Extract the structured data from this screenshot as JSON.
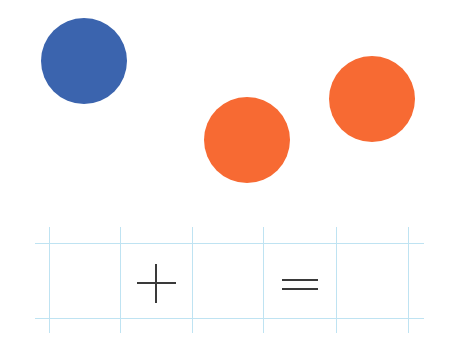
{
  "scene": {
    "description": "Counting dots addition worksheet",
    "dots": [
      {
        "color_name": "blue",
        "color": "#3b64ae",
        "cx": 84,
        "cy": 61,
        "r": 43
      },
      {
        "color_name": "orange",
        "color": "#f76a33",
        "cx": 247,
        "cy": 140,
        "r": 43
      },
      {
        "color_name": "orange",
        "color": "#f76a33",
        "cx": 372,
        "cy": 99,
        "r": 43
      }
    ],
    "equation": {
      "cells": [
        "",
        "+",
        "",
        "=",
        ""
      ],
      "operator_plus": "+",
      "operator_equals": "="
    },
    "grid_color": "#bfe3f2",
    "symbol_color": "#3a3a3a"
  }
}
